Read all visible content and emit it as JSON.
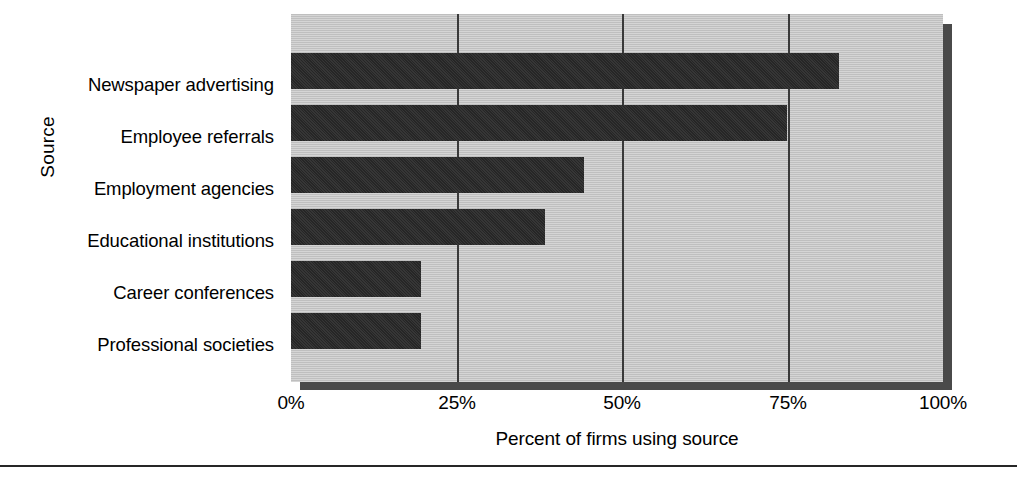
{
  "chart_data": {
    "type": "bar",
    "orientation": "horizontal",
    "title": "",
    "xlabel": "Percent of firms using source",
    "ylabel": "Source",
    "categories": [
      "Newspaper advertising",
      "Employee referrals",
      "Employment agencies",
      "Educational institutions",
      "Career conferences",
      "Professional societies"
    ],
    "values": [
      84,
      76,
      45,
      39,
      20,
      20
    ],
    "xlim": [
      0,
      100
    ],
    "xticks": [
      0,
      25,
      50,
      75,
      100
    ],
    "xtick_labels": [
      "0%",
      "25%",
      "50%",
      "75%",
      "100%"
    ],
    "grid": "vertical",
    "legend": "none",
    "bar_color": "#2b2b2b",
    "plot_background": "#c9c9c9",
    "shadow_color": "#4a4a4a",
    "page_background": "#ffffff"
  }
}
